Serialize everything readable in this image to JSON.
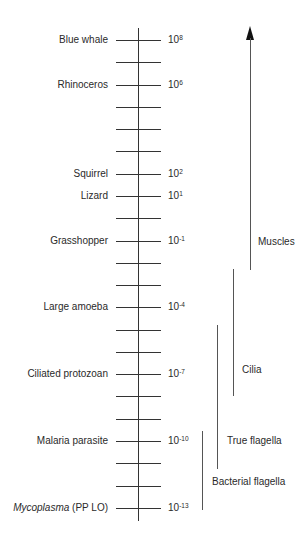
{
  "scale": {
    "rows": [
      {
        "organism": "Blue whale",
        "exponent": "8"
      },
      {
        "organism": "",
        "exponent": ""
      },
      {
        "organism": "Rhinoceros",
        "exponent": "6"
      },
      {
        "organism": "",
        "exponent": ""
      },
      {
        "organism": "",
        "exponent": ""
      },
      {
        "organism": "",
        "exponent": ""
      },
      {
        "organism": "Squirrel",
        "exponent": "2"
      },
      {
        "organism": "Lizard",
        "exponent": "1"
      },
      {
        "organism": "",
        "exponent": ""
      },
      {
        "organism": "Grasshopper",
        "exponent": "-1"
      },
      {
        "organism": "",
        "exponent": ""
      },
      {
        "organism": "",
        "exponent": ""
      },
      {
        "organism": "Large amoeba",
        "exponent": "-4"
      },
      {
        "organism": "",
        "exponent": ""
      },
      {
        "organism": "",
        "exponent": ""
      },
      {
        "organism": "Ciliated protozoan",
        "exponent": "-7"
      },
      {
        "organism": "",
        "exponent": ""
      },
      {
        "organism": "",
        "exponent": ""
      },
      {
        "organism": "Malaria parasite",
        "exponent": "-10"
      },
      {
        "organism": "",
        "exponent": ""
      },
      {
        "organism": "",
        "exponent": ""
      },
      {
        "organism": "Mycoplasma",
        "organism_suffix": "(PP LO)",
        "exponent": "-13"
      }
    ],
    "base": "10"
  },
  "mechanisms": {
    "muscles": "Muscles",
    "cilia": "Cilia",
    "true_flagella": "True flagella",
    "bacterial_flagella": "Bacterial flagella"
  }
}
